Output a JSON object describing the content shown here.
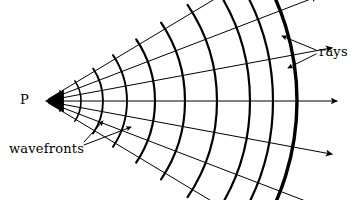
{
  "figure": {
    "background_color": "#ffffff",
    "ink_color": "#000000",
    "width": 359,
    "height": 200
  },
  "labels": {
    "source": "P",
    "wavefronts": "wavefronts",
    "rays": "rays"
  },
  "chart_data": {
    "type": "diagram",
    "source_point": {
      "label": "P",
      "x": 45,
      "y": 101
    },
    "ray_count": 7,
    "ray_angles_deg": [
      -31,
      -21,
      -10.5,
      0,
      10.5,
      21,
      31
    ],
    "ray_end_radius": 292,
    "wavefront_count": 10,
    "wavefront_radii": [
      18,
      36,
      58,
      82,
      110,
      140,
      172,
      205,
      228,
      252
    ],
    "wavefront_half_angle_deg": 34,
    "outer_wavefront_index": 9,
    "stroke_widths": {
      "ray": 1,
      "wavefront": 2.2,
      "outer_wavefront": 3.4,
      "leader": 1
    },
    "leaders": [
      {
        "from_label": "wavefronts",
        "x1": 84,
        "y1": 145,
        "x2": 131,
        "y2": 127
      },
      {
        "from_label": "wavefronts",
        "x1": 84,
        "y1": 142,
        "x2": 103,
        "y2": 121
      },
      {
        "from_label": "rays",
        "x1": 316,
        "y1": 50,
        "x2": 282,
        "y2": 36
      },
      {
        "from_label": "rays",
        "x1": 316,
        "y1": 54,
        "x2": 288,
        "y2": 68
      }
    ]
  }
}
